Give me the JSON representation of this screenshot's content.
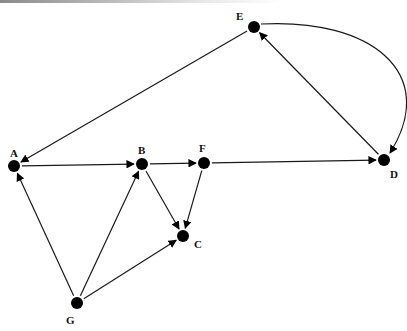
{
  "diagram": {
    "type": "directed-graph",
    "nodes": [
      {
        "id": "A",
        "label": "A",
        "x": 14,
        "y": 166,
        "lx": 10,
        "ly": 157
      },
      {
        "id": "B",
        "label": "B",
        "x": 142,
        "y": 164,
        "lx": 138,
        "ly": 154
      },
      {
        "id": "C",
        "label": "C",
        "x": 183,
        "y": 236,
        "lx": 194,
        "ly": 248
      },
      {
        "id": "D",
        "label": "D",
        "x": 384,
        "y": 160,
        "lx": 390,
        "ly": 178
      },
      {
        "id": "E",
        "label": "E",
        "x": 254,
        "y": 27,
        "lx": 236,
        "ly": 20
      },
      {
        "id": "F",
        "label": "F",
        "x": 204,
        "y": 163,
        "lx": 199,
        "ly": 152
      },
      {
        "id": "G",
        "label": "G",
        "x": 77,
        "y": 303,
        "lx": 66,
        "ly": 324
      }
    ],
    "edges": [
      {
        "from": "E",
        "to": "A",
        "curved": false
      },
      {
        "from": "D",
        "to": "E",
        "curved": false
      },
      {
        "from": "E",
        "to": "D",
        "curved": true
      },
      {
        "from": "A",
        "to": "B",
        "curved": false
      },
      {
        "from": "B",
        "to": "F",
        "curved": false
      },
      {
        "from": "F",
        "to": "D",
        "curved": false
      },
      {
        "from": "B",
        "to": "C",
        "curved": false
      },
      {
        "from": "F",
        "to": "C",
        "curved": false
      },
      {
        "from": "G",
        "to": "A",
        "curved": false
      },
      {
        "from": "G",
        "to": "B",
        "curved": false
      },
      {
        "from": "G",
        "to": "C",
        "curved": false
      }
    ],
    "colors": {
      "node": "#000000",
      "edge": "#1a1a1a",
      "label": "#111111"
    }
  }
}
